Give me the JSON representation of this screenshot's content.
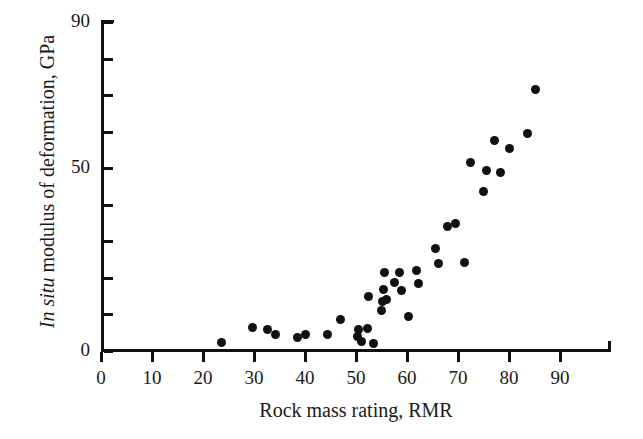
{
  "chart_data": {
    "type": "scatter",
    "title": "",
    "xlabel": "Rock mass rating, RMR",
    "ylabel_prefix": "In situ",
    "ylabel_rest": " modulus of deformation, GPa",
    "ylabel_full": "In situ modulus of deformation, GPa",
    "xlim": [
      0,
      100
    ],
    "ylim": [
      0,
      90
    ],
    "x_ticks": [
      0,
      10,
      20,
      30,
      40,
      50,
      60,
      70,
      80,
      90
    ],
    "x_tick_labels": [
      "0",
      "10",
      "20",
      "30",
      "40",
      "50",
      "60",
      "70",
      "80",
      "90"
    ],
    "y_ticks": [
      0,
      10,
      20,
      30,
      40,
      50,
      60,
      70,
      80,
      90
    ],
    "y_tick_labels": [
      "0",
      "",
      "",
      "",
      "",
      "50",
      "",
      "",
      "",
      "90"
    ],
    "grid": false,
    "legend": false,
    "marker": "filled-circle",
    "marker_color": "#111111",
    "marker_size_px": 9,
    "points": [
      {
        "x": 23.7,
        "y": 2.2
      },
      {
        "x": 29.8,
        "y": 6.3
      },
      {
        "x": 32.7,
        "y": 6.0
      },
      {
        "x": 34.3,
        "y": 4.4
      },
      {
        "x": 38.6,
        "y": 3.8
      },
      {
        "x": 40.0,
        "y": 4.6
      },
      {
        "x": 44.5,
        "y": 4.4
      },
      {
        "x": 47.0,
        "y": 8.5
      },
      {
        "x": 50.3,
        "y": 4.0
      },
      {
        "x": 50.5,
        "y": 6.0
      },
      {
        "x": 51.0,
        "y": 2.6
      },
      {
        "x": 52.2,
        "y": 6.1
      },
      {
        "x": 52.5,
        "y": 15.0
      },
      {
        "x": 53.4,
        "y": 2.0
      },
      {
        "x": 55.0,
        "y": 11.2
      },
      {
        "x": 55.2,
        "y": 13.5
      },
      {
        "x": 55.4,
        "y": 16.8
      },
      {
        "x": 55.6,
        "y": 21.5
      },
      {
        "x": 56.0,
        "y": 14.2
      },
      {
        "x": 57.5,
        "y": 18.8
      },
      {
        "x": 58.5,
        "y": 21.4
      },
      {
        "x": 59.0,
        "y": 16.5
      },
      {
        "x": 60.2,
        "y": 9.3
      },
      {
        "x": 61.8,
        "y": 22.0
      },
      {
        "x": 62.2,
        "y": 18.5
      },
      {
        "x": 65.5,
        "y": 28.0
      },
      {
        "x": 66.2,
        "y": 24.0
      },
      {
        "x": 68.0,
        "y": 34.0
      },
      {
        "x": 69.5,
        "y": 35.0
      },
      {
        "x": 71.3,
        "y": 24.2
      },
      {
        "x": 72.5,
        "y": 51.5
      },
      {
        "x": 75.0,
        "y": 43.5
      },
      {
        "x": 75.5,
        "y": 49.5
      },
      {
        "x": 77.2,
        "y": 57.5
      },
      {
        "x": 78.3,
        "y": 48.8
      },
      {
        "x": 80.0,
        "y": 55.5
      },
      {
        "x": 83.6,
        "y": 59.5
      },
      {
        "x": 85.2,
        "y": 71.5
      }
    ]
  },
  "axis_geometry": {
    "x_origin_px": 101,
    "x_scale_px_per_unit": 5.1,
    "y_origin_px": 351,
    "y_scale_px_per_unit": 3.656
  }
}
